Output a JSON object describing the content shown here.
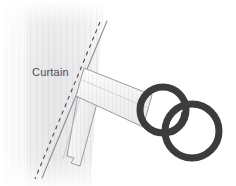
{
  "figure": {
    "background_color": "#ffffff",
    "labels": {
      "curtain": "Curtain"
    },
    "label_positions": {
      "curtain": {
        "x": 32,
        "y": 76
      }
    },
    "colors": {
      "background": "#ffffff",
      "curtain_light": "#ffffff",
      "curtain_shade": "#e3e3e5",
      "curtain_pleat": "#dcdcde",
      "outline": "#8a8a8e",
      "dashed_line": "#4c4c50",
      "strap_fill_light": "#fdfdfd",
      "strap_fill_shade": "#ececee",
      "strap_outline": "#9a9a9e",
      "ring": "#3c3c3c",
      "label_text": "#4a4a4f"
    },
    "elements": [
      {
        "name": "curtain-panel",
        "type": "gradient-shape",
        "description": "Pleated curtain panel shaded left to right"
      },
      {
        "name": "curtain-dashed-hem",
        "type": "dashed-line",
        "description": "Dashed stitching line along the curtain edge"
      },
      {
        "name": "curtain-edge-line",
        "type": "line",
        "description": "Solid edge line of the curtain"
      },
      {
        "name": "upper-strap",
        "type": "quad",
        "description": "Upper tab strap running to the first ring"
      },
      {
        "name": "lower-strap",
        "type": "quad",
        "description": "Lower tab strap hanging down-left"
      },
      {
        "name": "ring-left",
        "type": "ring",
        "cx": 163,
        "cy": 110,
        "rx": 24,
        "ry": 24,
        "stroke_width": 7
      },
      {
        "name": "ring-right",
        "type": "ring",
        "cx": 192,
        "cy": 131,
        "rx": 28,
        "ry": 28,
        "stroke_width": 7
      }
    ]
  }
}
